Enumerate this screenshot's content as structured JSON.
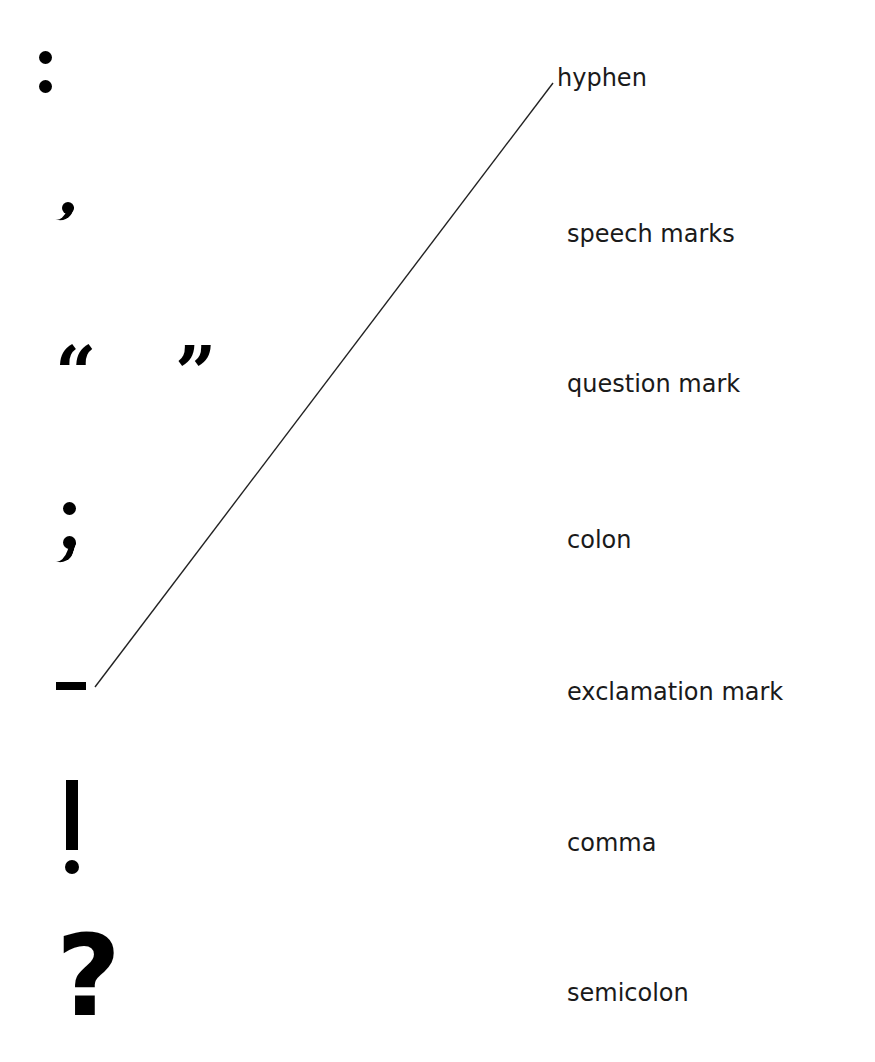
{
  "worksheet": {
    "type": "match punctuation marks to names",
    "symbols": [
      {
        "id": "colon",
        "glyph": ":"
      },
      {
        "id": "comma",
        "glyph": ","
      },
      {
        "id": "speech-marks",
        "glyph": "“   ”"
      },
      {
        "id": "semicolon",
        "glyph": ";"
      },
      {
        "id": "hyphen",
        "glyph": "-"
      },
      {
        "id": "exclamation-mark",
        "glyph": "!"
      },
      {
        "id": "question-mark",
        "glyph": "?"
      }
    ],
    "labels": [
      "hyphen",
      "speech marks",
      "question mark",
      "colon",
      "exclamation mark",
      "comma",
      "semicolon"
    ],
    "connections": [
      {
        "from_symbol": "hyphen",
        "to_label": "hyphen",
        "x1": 95,
        "y1": 687,
        "x2": 553,
        "y2": 83
      }
    ],
    "colors": {
      "background": "#ffffff",
      "ink": "#000000",
      "line": "#222222"
    }
  }
}
